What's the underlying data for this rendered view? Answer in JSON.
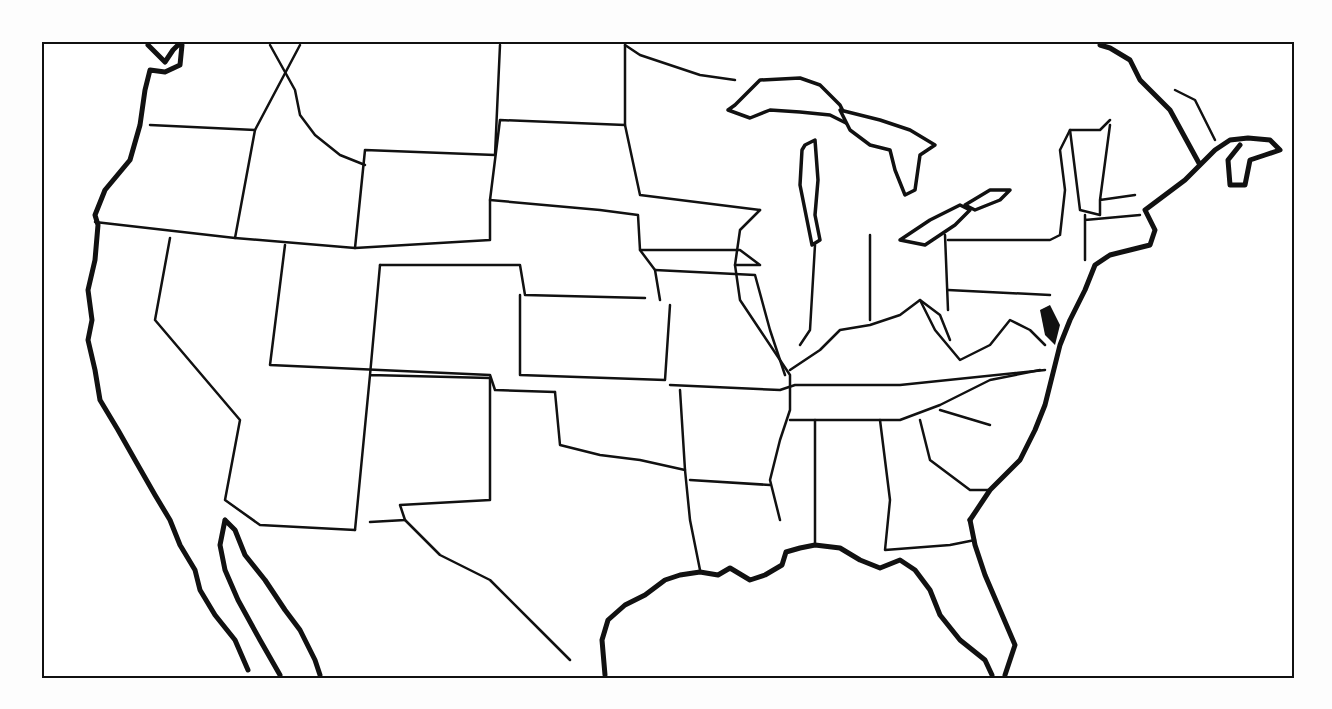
{
  "map": {
    "title": "",
    "type": "blank outline map",
    "region": "Contiguous United States",
    "labels": [],
    "colors": {
      "background": "#ffffff",
      "line": "#111111"
    }
  }
}
